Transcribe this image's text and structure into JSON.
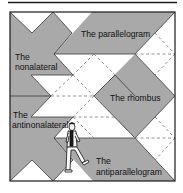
{
  "colors": {
    "background": "#ffffff",
    "tile_gray": "#a9a9a9",
    "outline": "#1a1a1a",
    "dashed": "#7a7a7a"
  },
  "labels": {
    "parallelogram": "The parallelogram",
    "nonalateral_line1": "The",
    "nonalateral_line2": "nonalateral",
    "rhombus": "The rhombus",
    "antinonalateral_line1": "The",
    "antinonalateral_line2": "antinonalateral",
    "antiparallelogram_line1": "The",
    "antiparallelogram_line2": "antiparallelogram"
  }
}
